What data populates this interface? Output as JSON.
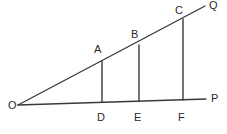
{
  "figure": {
    "background_color": "#ffffff",
    "line_color": "#3a3a3a",
    "label_color": "#2a2a2a",
    "stroke_width": 1.4,
    "labels": {
      "O": "O",
      "A": "A",
      "B": "B",
      "C": "C",
      "Q": "Q",
      "D": "D",
      "E": "E",
      "F": "F",
      "P": "P"
    },
    "label_positions": {
      "O": {
        "x": 8,
        "y": 100
      },
      "A": {
        "x": 94,
        "y": 44
      },
      "B": {
        "x": 131,
        "y": 29
      },
      "C": {
        "x": 175,
        "y": 5
      },
      "Q": {
        "x": 209,
        "y": 0
      },
      "D": {
        "x": 97,
        "y": 112
      },
      "E": {
        "x": 134,
        "y": 112
      },
      "F": {
        "x": 178,
        "y": 112
      },
      "P": {
        "x": 211,
        "y": 93
      }
    },
    "points": {
      "O": {
        "x": 18,
        "y": 105
      },
      "A": {
        "x": 102,
        "y": 61
      },
      "B": {
        "x": 139,
        "y": 45
      },
      "C": {
        "x": 183,
        "y": 19
      },
      "Q": {
        "x": 205,
        "y": 6
      },
      "D": {
        "x": 102,
        "y": 102
      },
      "E": {
        "x": 139,
        "y": 101
      },
      "F": {
        "x": 183,
        "y": 100
      },
      "P": {
        "x": 206,
        "y": 99
      }
    },
    "segments": [
      {
        "name": "ray-OQ",
        "from": "O",
        "to": "Q"
      },
      {
        "name": "ray-OP",
        "from": "O",
        "to": "P"
      },
      {
        "name": "segment-AD",
        "from": "A",
        "to": "D"
      },
      {
        "name": "segment-BE",
        "from": "B",
        "to": "E"
      },
      {
        "name": "segment-CF",
        "from": "C",
        "to": "F"
      }
    ]
  }
}
